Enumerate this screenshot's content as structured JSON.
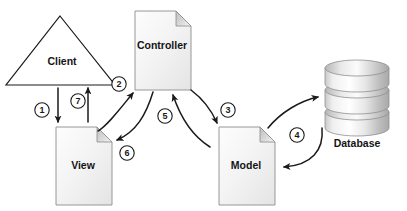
{
  "diagram": {
    "background_color": "#ffffff",
    "line_color": "#1a1a1a",
    "text_color": "#141414",
    "shape_fill": "#f2f2f2",
    "shape_stroke": "#8c8c8c",
    "nodes": [
      {
        "id": "client",
        "label": "Client",
        "shape": "triangle",
        "x": 70,
        "y": 58
      },
      {
        "id": "controller",
        "label": "Controller",
        "shape": "document",
        "x": 162,
        "y": 44
      },
      {
        "id": "view",
        "label": "View",
        "shape": "document",
        "x": 84,
        "y": 164
      },
      {
        "id": "model",
        "label": "Model",
        "shape": "document",
        "x": 246,
        "y": 164
      },
      {
        "id": "database",
        "label": "Database",
        "shape": "cylinder-stack",
        "x": 357,
        "y": 144
      }
    ],
    "steps": [
      {
        "number": "1",
        "label_x": 42,
        "label_y": 110,
        "from": "client",
        "to": "view"
      },
      {
        "number": "2",
        "label_x": 119,
        "label_y": 84,
        "from": "view",
        "to": "controller"
      },
      {
        "number": "3",
        "label_x": 228,
        "label_y": 110,
        "from": "controller",
        "to": "model"
      },
      {
        "number": "4",
        "label_x": 297,
        "label_y": 135,
        "from": "database",
        "to": "model"
      },
      {
        "number": "5",
        "label_x": 165,
        "label_y": 116,
        "from": "model",
        "to": "controller"
      },
      {
        "number": "6",
        "label_x": 127,
        "label_y": 153,
        "from": "controller",
        "to": "view"
      },
      {
        "number": "7",
        "label_x": 78,
        "label_y": 101,
        "from": "view",
        "to": "client"
      }
    ]
  }
}
